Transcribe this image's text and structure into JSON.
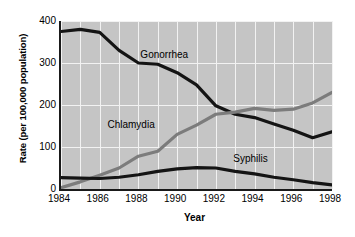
{
  "chart_data": {
    "type": "line",
    "title": "",
    "xlabel": "Year",
    "ylabel": "Rate (per 100,000 population)",
    "x": [
      1984,
      1985,
      1986,
      1987,
      1988,
      1989,
      1990,
      1991,
      1992,
      1993,
      1994,
      1995,
      1996,
      1997,
      1998
    ],
    "xticks": [
      "1984",
      "1986",
      "1988",
      "1990",
      "1992",
      "1994",
      "1996",
      "1998"
    ],
    "yticks": [
      "0",
      "100",
      "200",
      "300",
      "400"
    ],
    "xlim": [
      1984,
      1998
    ],
    "ylim": [
      0,
      400
    ],
    "grid": true,
    "legend_position": "inline-annotations",
    "series": [
      {
        "name": "Gonorrhea",
        "color": "#141414",
        "label_x": 1988.1,
        "label_y": 318,
        "values": [
          375,
          380,
          373,
          330,
          300,
          297,
          277,
          248,
          198,
          178,
          170,
          155,
          140,
          122,
          136
        ]
      },
      {
        "name": "Chlamydia",
        "color": "#7c7c7c",
        "label_x": 1986.4,
        "label_y": 152,
        "values": [
          3,
          17,
          33,
          50,
          78,
          90,
          130,
          152,
          178,
          183,
          192,
          187,
          190,
          205,
          230
        ]
      },
      {
        "name": "Syphilis",
        "color": "#141414",
        "label_x": 1992.9,
        "label_y": 72,
        "values": [
          27,
          26,
          25,
          28,
          34,
          42,
          48,
          51,
          50,
          42,
          36,
          28,
          22,
          15,
          10
        ]
      }
    ]
  }
}
